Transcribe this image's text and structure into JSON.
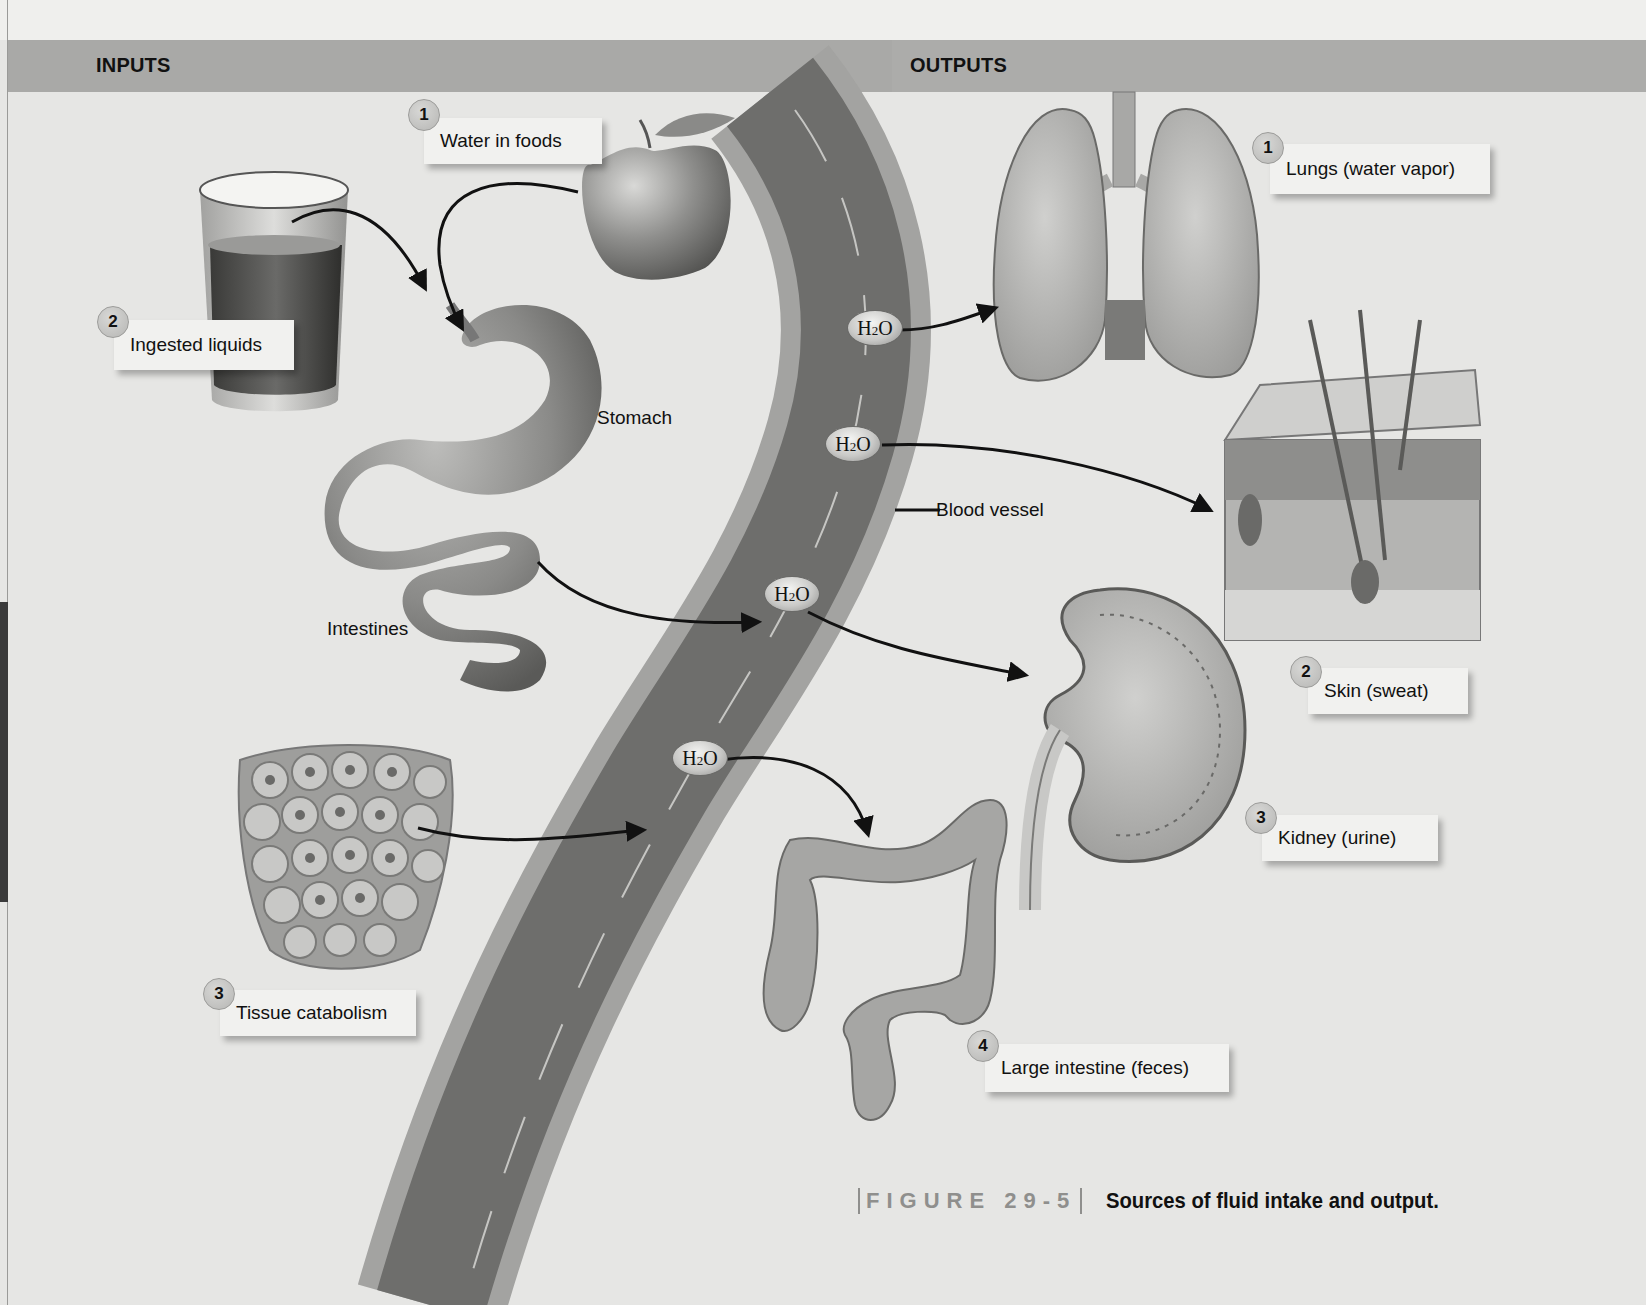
{
  "headers": {
    "inputs": "INPUTS",
    "outputs": "OUTPUTS"
  },
  "inputs": [
    {
      "number": "1",
      "label": "Water in foods",
      "icon": "apple-icon"
    },
    {
      "number": "2",
      "label": "Ingested liquids",
      "icon": "glass-of-water-icon"
    },
    {
      "number": "3",
      "label": "Tissue catabolism",
      "icon": "tissue-cells-icon"
    }
  ],
  "outputs": [
    {
      "number": "1",
      "label": "Lungs (water vapor)",
      "icon": "lungs-icon"
    },
    {
      "number": "2",
      "label": "Skin (sweat)",
      "icon": "skin-cross-section-icon"
    },
    {
      "number": "3",
      "label": "Kidney (urine)",
      "icon": "kidney-icon"
    },
    {
      "number": "4",
      "label": "Large intestine (feces)",
      "icon": "large-intestine-icon"
    }
  ],
  "structure_labels": {
    "stomach": "Stomach",
    "intestines": "Intestines",
    "blood_vessel": "Blood vessel"
  },
  "molecule": {
    "symbol_main": "H",
    "symbol_sub": "2",
    "symbol_tail": "O"
  },
  "caption": {
    "figure_number": "FIGURE 29-5",
    "title": "Sources of fluid intake and output."
  },
  "colors": {
    "background": "#e6e6e4",
    "header_band": "#a9a9a7",
    "vessel_dark": "#6e6e6c",
    "vessel_wall": "#a3a3a1",
    "text": "#111111"
  }
}
